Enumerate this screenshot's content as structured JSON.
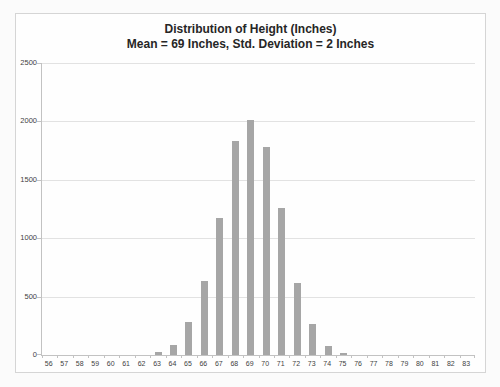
{
  "page": {
    "background": "#fbfbfb"
  },
  "chart": {
    "title": "Distribution of Height (Inches)",
    "subtitle": "Mean = 69 Inches, Std. Deviation = 2 Inches",
    "colors": {
      "page_bg": "#fbfbfb",
      "chart_bg": "#fefefe",
      "frame_border": "#d5d5d5",
      "bar": "#a6a6a6",
      "gridline": "#e2e2e2",
      "axis": "#c2c2c2",
      "title_text": "#262626",
      "tick_text": "#3f3f3f"
    }
  },
  "chart_data": {
    "type": "bar",
    "title": "Distribution of Height (Inches)",
    "subtitle": "Mean = 69 Inches, Std. Deviation = 2 Inches",
    "categories": [
      56,
      57,
      58,
      59,
      60,
      61,
      62,
      63,
      64,
      65,
      66,
      67,
      68,
      69,
      70,
      71,
      72,
      73,
      74,
      75,
      76,
      77,
      78,
      79,
      80,
      81,
      82,
      83
    ],
    "values": [
      0,
      0,
      0,
      0,
      0,
      0,
      0,
      25,
      85,
      285,
      630,
      1175,
      1830,
      2010,
      1780,
      1255,
      620,
      265,
      80,
      20,
      0,
      0,
      0,
      0,
      0,
      0,
      0,
      0
    ],
    "xlabel": "",
    "ylabel": "",
    "ylim": [
      0,
      2500
    ],
    "yticks": [
      0,
      500,
      1000,
      1500,
      2000,
      2500
    ],
    "grid": "horizontal",
    "legend": "none",
    "bar_color": "#a6a6a6"
  }
}
